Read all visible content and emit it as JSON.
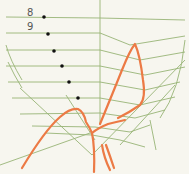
{
  "figure": {
    "labels": [
      {
        "text": "8",
        "x": 27,
        "y": 8
      },
      {
        "text": "9",
        "x": 27,
        "y": 22
      }
    ],
    "colors": {
      "background": "#f7f6ef",
      "green_thread": "#8fae6a",
      "orange_thread": "#ec7a45",
      "dot": "#111111"
    },
    "dots": [
      {
        "x": 44,
        "y": 17
      },
      {
        "x": 48,
        "y": 34
      },
      {
        "x": 54,
        "y": 51
      },
      {
        "x": 62,
        "y": 66
      },
      {
        "x": 69,
        "y": 82
      },
      {
        "x": 78,
        "y": 98
      }
    ]
  }
}
